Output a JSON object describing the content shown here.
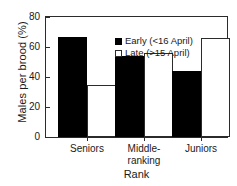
{
  "chart_data": {
    "type": "bar",
    "title": "",
    "xlabel": "Rank",
    "ylabel": "Males per brood (%)",
    "categories": [
      "Seniors",
      "Middle-\nranking",
      "Juniors"
    ],
    "series": [
      {
        "name": "Early (<16 April)",
        "values": [
          67,
          54,
          44
        ],
        "color": "#000000",
        "fill": "solid"
      },
      {
        "name": "Late (>15 April)",
        "values": [
          35,
          56,
          66
        ],
        "color": "#ffffff",
        "fill": "open"
      }
    ],
    "ylim": [
      0,
      80
    ],
    "yticks": [
      0,
      20,
      40,
      60,
      80
    ],
    "ytick_labels": [
      "0",
      "20",
      "40",
      "60",
      "80"
    ],
    "grid": false,
    "legend_position": "top-center"
  },
  "legend": {
    "items": [
      {
        "label": "Early (<16 April)"
      },
      {
        "label": "Late (>15 April)"
      }
    ]
  }
}
